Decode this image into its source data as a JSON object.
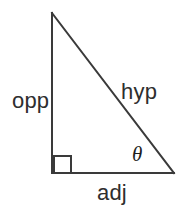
{
  "diagram": {
    "name": "right-triangle-trigonometry",
    "background_color": "#ffffff",
    "stroke_color": "#3a3a3a",
    "stroke_width": 2,
    "text_color": "#2e2e2e",
    "canvas": {
      "width": 176,
      "height": 210
    },
    "vertices": {
      "apex": {
        "x": 52,
        "y": 13
      },
      "right_angle": {
        "x": 52,
        "y": 173
      },
      "theta_vertex": {
        "x": 174,
        "y": 173
      }
    },
    "right_angle_marker": {
      "name": "right-angle-square",
      "x": 53,
      "y": 155,
      "size": 17,
      "degrees": "90"
    },
    "labels": {
      "opposite": "opp",
      "hypotenuse": "hyp",
      "adjacent": "adj",
      "angle": "θ"
    }
  },
  "chart_data": {
    "type": "diagram",
    "shape": "right-triangle",
    "vertices": [
      {
        "id": "apex",
        "x": 52,
        "y": 13
      },
      {
        "id": "right-angle-corner",
        "x": 52,
        "y": 173
      },
      {
        "id": "theta-corner",
        "x": 174,
        "y": 173
      }
    ],
    "edges": [
      {
        "id": "opposite",
        "label": "opp",
        "from": "apex",
        "to": "right-angle-corner",
        "orientation": "vertical",
        "length_px": 160
      },
      {
        "id": "hypotenuse",
        "label": "hyp",
        "from": "apex",
        "to": "theta-corner",
        "orientation": "diagonal",
        "length_px": 201
      },
      {
        "id": "adjacent",
        "label": "adj",
        "from": "right-angle-corner",
        "to": "theta-corner",
        "orientation": "horizontal",
        "length_px": 122
      }
    ],
    "angles": [
      {
        "id": "theta",
        "label": "θ",
        "at_vertex": "theta-corner",
        "approx_degrees": 52.7
      },
      {
        "id": "right-angle",
        "label": "90°",
        "at_vertex": "right-angle-corner",
        "approx_degrees": 90,
        "marker": "square"
      }
    ],
    "xlabel": "",
    "ylabel": "",
    "grid": false,
    "legend": "none"
  }
}
